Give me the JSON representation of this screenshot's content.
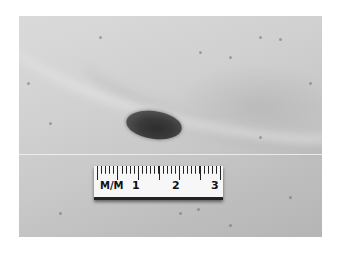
{
  "image": {
    "description": "Grayscale clinical photograph of a dark oval skin lesion with a millimeter ruler below it",
    "colors": {
      "background": "#ffffff",
      "skin_light": "#d8d8d8",
      "skin_dark": "#b5b5b5",
      "lesion": "#333333",
      "ruler": "#f7f7f7"
    }
  },
  "ruler": {
    "unit_label": "M/M",
    "marks": [
      "1",
      "2",
      "3"
    ]
  }
}
